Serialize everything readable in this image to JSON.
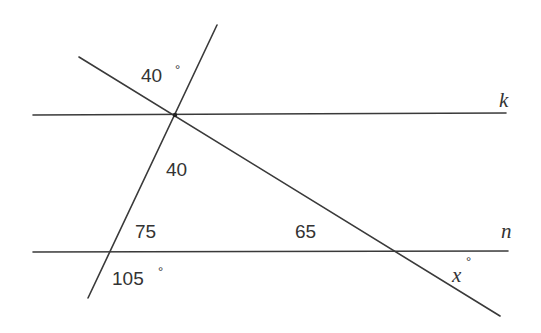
{
  "diagram": {
    "lines": {
      "k": {
        "label": "k",
        "x1": 33,
        "y1": 115,
        "x2": 506,
        "y2": 113
      },
      "n": {
        "label": "n",
        "x1": 33,
        "y1": 252,
        "x2": 508,
        "y2": 251
      },
      "transversal_steep": {
        "x1": 217,
        "y1": 25,
        "x2": 88,
        "y2": 298
      },
      "transversal_diagonal": {
        "x1": 79,
        "y1": 57,
        "x2": 500,
        "y2": 316
      }
    },
    "angle_labels": {
      "top_angle": {
        "value": "40",
        "unit": "°"
      },
      "triangle_top": {
        "value": "40"
      },
      "triangle_left": {
        "value": "75"
      },
      "triangle_right": {
        "value": "65"
      },
      "bottom_left": {
        "value": "105",
        "unit": "°"
      },
      "unknown": {
        "value": "x",
        "unit": "°"
      }
    },
    "colors": {
      "line": "#3a3a3a",
      "text": "#333333",
      "background": "#ffffff"
    }
  }
}
